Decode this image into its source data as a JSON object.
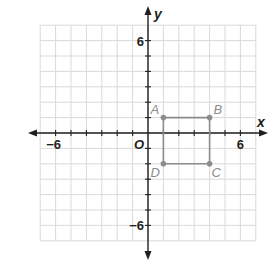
{
  "diagram": {
    "type": "coordinate-plane",
    "axes": {
      "x_label": "x",
      "y_label": "y",
      "origin_label": "O",
      "x_range": [
        -7,
        7
      ],
      "y_range": [
        -7,
        7
      ],
      "tick_labels": {
        "x_neg": "−6",
        "x_pos": "6",
        "y_pos": "6",
        "y_neg": "−6"
      }
    },
    "polygon": {
      "name": "ABCD",
      "vertices": [
        {
          "label": "A",
          "x": 1,
          "y": 1
        },
        {
          "label": "B",
          "x": 4,
          "y": 1
        },
        {
          "label": "C",
          "x": 4,
          "y": -2
        },
        {
          "label": "D",
          "x": 1,
          "y": -2
        }
      ]
    },
    "colors": {
      "grid": "#d9d9d9",
      "axis": "#231f20",
      "polygon": "#8c8c8c",
      "point_label": "#8c8c8c"
    }
  }
}
